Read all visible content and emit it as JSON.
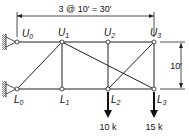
{
  "diagram": {
    "type": "truss",
    "span_dimension": "3 @ 10′ = 30′",
    "height_dimension": "10′",
    "nodes": {
      "U0": {
        "label": "U",
        "sub": "0"
      },
      "U1": {
        "label": "U",
        "sub": "1"
      },
      "U2": {
        "label": "U",
        "sub": "2"
      },
      "U3": {
        "label": "U",
        "sub": "3"
      },
      "L0": {
        "label": "L",
        "sub": "0"
      },
      "L1": {
        "label": "L",
        "sub": "1"
      },
      "L2": {
        "label": "L",
        "sub": "2"
      },
      "L3": {
        "label": "L",
        "sub": "3"
      }
    },
    "members": [
      [
        "U0",
        "U1"
      ],
      [
        "U1",
        "U2"
      ],
      [
        "U2",
        "U3"
      ],
      [
        "L0",
        "L1"
      ],
      [
        "L1",
        "L2"
      ],
      [
        "L2",
        "L3"
      ],
      [
        "U1",
        "L1"
      ],
      [
        "U2",
        "L2"
      ],
      [
        "U3",
        "L3"
      ],
      [
        "L0",
        "U1"
      ],
      [
        "U1",
        "L3"
      ],
      [
        "L2",
        "U3"
      ]
    ],
    "supports": [
      "U0 pin",
      "L0 pin"
    ],
    "loads": [
      {
        "node": "L2",
        "label": "10 k"
      },
      {
        "node": "L3",
        "label": "15 k"
      }
    ]
  }
}
